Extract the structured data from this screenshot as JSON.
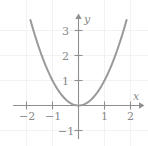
{
  "chart_data": {
    "type": "line",
    "title": "",
    "xlabel": "x",
    "ylabel": "y",
    "function": "y = x^2",
    "xlim": [
      -2.5,
      2.3
    ],
    "ylim": [
      -1.6,
      3.45
    ],
    "grid": true,
    "legend": null,
    "x": [
      -1.85,
      -1.7,
      -1.5,
      -1.25,
      -1.0,
      -0.75,
      -0.5,
      -0.25,
      0,
      0.25,
      0.5,
      0.75,
      1.0,
      1.25,
      1.5,
      1.7,
      1.85
    ],
    "values": [
      3.4225,
      2.89,
      2.25,
      1.5625,
      1.0,
      0.5625,
      0.25,
      0.0625,
      0,
      0.0625,
      0.25,
      0.5625,
      1.0,
      1.5625,
      2.25,
      2.89,
      3.4225
    ],
    "xticks": [
      {
        "value": -2,
        "label": "−2"
      },
      {
        "value": -1,
        "label": "−1"
      },
      {
        "value": 1,
        "label": "1"
      },
      {
        "value": 2,
        "label": "2"
      }
    ],
    "yticks": [
      {
        "value": -1,
        "label": "−1"
      },
      {
        "value": 1,
        "label": "1"
      },
      {
        "value": 2,
        "label": "2"
      },
      {
        "value": 3,
        "label": "3"
      }
    ],
    "colors": {
      "curve": "#9a9a9a",
      "axis": "#8f8f8f",
      "grid": "#f2f0ee",
      "label": "#8a8a8a",
      "background": "#ffffff"
    }
  },
  "axes": {
    "x_axis_label": "x",
    "y_axis_label": "y"
  },
  "labels": {
    "x_neg2": "−2",
    "x_neg1": "−1",
    "x_pos1": "1",
    "x_pos2": "2",
    "y_neg1": "−1",
    "y_pos1": "1",
    "y_pos2": "2",
    "y_pos3": "3"
  }
}
